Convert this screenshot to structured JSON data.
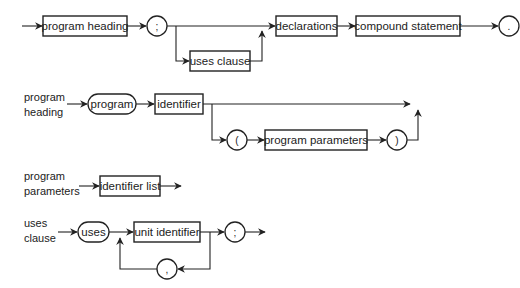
{
  "diagrams": {
    "program": {
      "label": "",
      "nodes": {
        "program_heading": "program heading",
        "semicolon": ";",
        "uses_clause": "uses clause",
        "declarations": "declarations",
        "compound_statement": "compound statement",
        "period": "."
      }
    },
    "program_heading": {
      "label_line1": "program",
      "label_line2": "heading",
      "nodes": {
        "program_keyword": "program",
        "identifier": "identifier",
        "open_paren": "(",
        "program_parameters": "program parameters",
        "close_paren": ")"
      }
    },
    "program_parameters": {
      "label_line1": "program",
      "label_line2": "parameters",
      "nodes": {
        "identifier_list": "identifier list"
      }
    },
    "uses_clause": {
      "label_line1": "uses",
      "label_line2": "clause",
      "nodes": {
        "uses_keyword": "uses",
        "unit_identifier": "unit identifier",
        "semicolon": ";",
        "comma": ","
      }
    }
  },
  "colors": {
    "stroke": "#222222",
    "background": "#ffffff"
  }
}
